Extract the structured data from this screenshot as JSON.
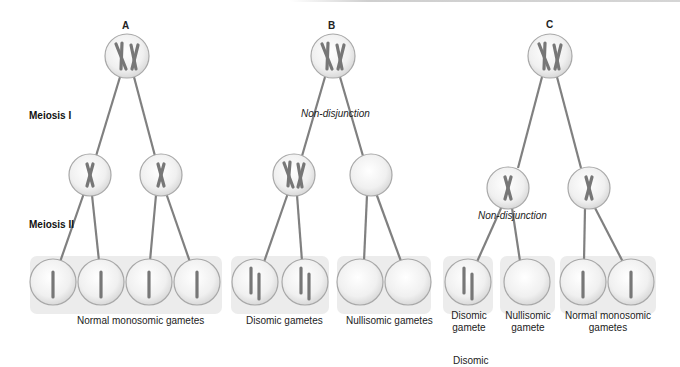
{
  "stages": {
    "meiosis1": "Meiosis I",
    "meiosis2": "Meiosis II"
  },
  "panels": [
    {
      "letter": "A",
      "captions": [
        "Normal monosomic gametes"
      ]
    },
    {
      "letter": "B",
      "annotation": "Non-disjunction",
      "captions": [
        "Disomic gametes",
        "Nullisomic gametes"
      ]
    },
    {
      "letter": "C",
      "annotation": "Non-disjunction",
      "captions": [
        "Disomic\ngamete",
        "Nullisomic\ngamete",
        "Normal monosomic\ngametes"
      ]
    }
  ],
  "footer_label": "Disomic",
  "colors": {
    "chromosome": "#7a7a7a",
    "line": "#808080",
    "cell_fill": "#efefef",
    "cell_stroke": "#a8a8a8",
    "panel_bg": "#ececec"
  }
}
